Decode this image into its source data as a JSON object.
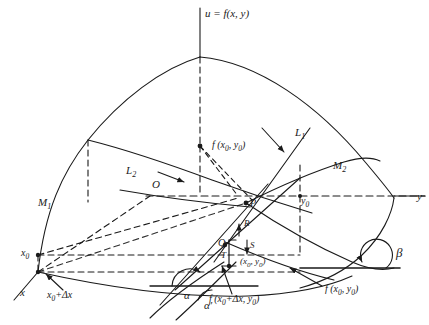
{
  "figure": {
    "background_color": "#ffffff",
    "ink_color": "#1a1a1a",
    "width": 429,
    "height": 325
  },
  "axes": [
    {
      "id": "u-axis",
      "label": "u = f(x, y)",
      "x": 205,
      "y": 12,
      "orientation": "vertical-up"
    },
    {
      "id": "y-axis",
      "label": "y",
      "x": 417,
      "y": 199,
      "orientation": "right"
    },
    {
      "id": "x-axis",
      "label": "x",
      "x": 20,
      "y": 295,
      "orientation": "lower-left"
    }
  ],
  "surface_labels": [
    {
      "id": "M1",
      "label": "M",
      "sub": "1",
      "x": 38,
      "y": 205
    },
    {
      "id": "M2",
      "label": "M",
      "sub": "2",
      "x": 333,
      "y": 168
    }
  ],
  "tangent_lines": [
    {
      "id": "L1",
      "label": "L",
      "sub": "1",
      "x": 295,
      "y": 135
    },
    {
      "id": "L2",
      "label": "L",
      "sub": "2",
      "x": 132,
      "y": 173
    }
  ],
  "points": [
    {
      "id": "O",
      "label": "O",
      "x": 156,
      "y": 184
    },
    {
      "id": "P",
      "label": "P",
      "x": 246,
      "y": 203
    },
    {
      "id": "Q",
      "label": "Q",
      "x": 225,
      "y": 242
    },
    {
      "id": "R",
      "label": "R",
      "x": 243,
      "y": 227
    },
    {
      "id": "S",
      "label": "S",
      "x": 249,
      "y": 249
    },
    {
      "id": "T",
      "label": "T",
      "x": 229,
      "y": 256
    }
  ],
  "value_labels": [
    {
      "id": "f-x0-y0-top",
      "text": "f (x",
      "sub1": "0",
      "mid": ", y",
      "sub2": "0",
      "tail": ")",
      "x": 172,
      "y": 146
    },
    {
      "id": "f-x0-y0-right",
      "text": "f (x",
      "sub1": "0",
      "mid": ", y",
      "sub2": "0",
      "tail": ")",
      "x": 325,
      "y": 290
    },
    {
      "id": "f-x0dx-y0",
      "text": "f (x",
      "sub1": "0",
      "mid": "+Δx, y",
      "sub2": "0",
      "tail": ")",
      "x": 211,
      "y": 300
    },
    {
      "id": "point-x0-y0",
      "text": "(x",
      "sub1": "0",
      "mid": ", y",
      "sub2": "0",
      "tail": ")",
      "x": 240,
      "y": 262
    }
  ],
  "coordinate_marks": [
    {
      "id": "x0",
      "text": "x",
      "sub": "0",
      "tail": "",
      "x": 23,
      "y": 255
    },
    {
      "id": "x0-plus-dx",
      "text": "x",
      "sub": "0",
      "tail": "+Δx",
      "x": 47,
      "y": 296
    },
    {
      "id": "y0",
      "text": "y",
      "sub": "0",
      "tail": "",
      "x": 370,
      "y": 200
    }
  ],
  "angles": [
    {
      "id": "alpha",
      "label": "α",
      "x": 186,
      "y": 297
    },
    {
      "id": "alpha-prime",
      "label": "α′",
      "x": 206,
      "y": 307
    },
    {
      "id": "beta",
      "label": "β",
      "x": 398,
      "y": 255
    }
  ]
}
